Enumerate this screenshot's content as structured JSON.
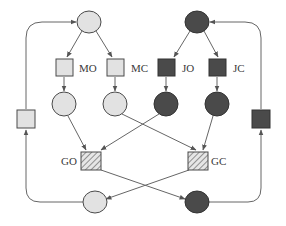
{
  "diagram": {
    "type": "petri-net",
    "colors": {
      "light_fill": "#e2e2e2",
      "dark_fill": "#4a4a4a",
      "stroke": "#4a4a4a",
      "arc": "#6a6a6a"
    },
    "places": [
      {
        "id": "p_top_light",
        "shade": "light"
      },
      {
        "id": "p_top_dark",
        "shade": "dark"
      },
      {
        "id": "p_mo_out",
        "shade": "light"
      },
      {
        "id": "p_mc_out",
        "shade": "light"
      },
      {
        "id": "p_jo_out",
        "shade": "dark"
      },
      {
        "id": "p_jc_out",
        "shade": "dark"
      },
      {
        "id": "p_bottom_light",
        "shade": "light"
      },
      {
        "id": "p_bottom_dark",
        "shade": "dark"
      }
    ],
    "transitions": [
      {
        "id": "MO",
        "label": "MO",
        "shade": "light"
      },
      {
        "id": "MC",
        "label": "MC",
        "shade": "light"
      },
      {
        "id": "JO",
        "label": "JO",
        "shade": "dark"
      },
      {
        "id": "JC",
        "label": "JC",
        "shade": "dark"
      },
      {
        "id": "GO",
        "label": "GO",
        "shade": "hatched"
      },
      {
        "id": "GC",
        "label": "GC",
        "shade": "hatched"
      },
      {
        "id": "t_left",
        "label": "",
        "shade": "light"
      },
      {
        "id": "t_right",
        "label": "",
        "shade": "dark"
      }
    ]
  },
  "labels": {
    "mo": "MO",
    "mc": "MC",
    "jo": "JO",
    "jc": "JC",
    "go": "GO",
    "gc": "GC"
  }
}
